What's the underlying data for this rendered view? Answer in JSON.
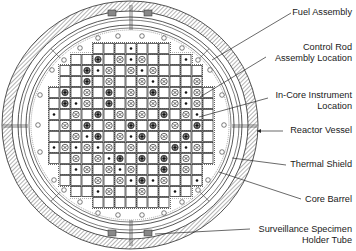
{
  "diagram": {
    "labels": [
      {
        "id": "fuel-assembly",
        "lines": [
          "Fuel Assembly"
        ],
        "x": 352,
        "y": 7,
        "target": [
          212,
          60
        ],
        "anchor": [
          291,
          13
        ]
      },
      {
        "id": "control-rod",
        "lines": [
          "Control Rod",
          "Assembly Location"
        ],
        "x": 352,
        "y": 42,
        "target": [
          200,
          97
        ],
        "anchor": [
          266,
          57
        ]
      },
      {
        "id": "in-core-instrument",
        "lines": [
          "In-Core Instrument",
          "Location"
        ],
        "x": 352,
        "y": 90,
        "target": [
          199,
          117
        ],
        "anchor": [
          268,
          98
        ]
      },
      {
        "id": "reactor-vessel",
        "lines": [
          "Reactor Vessel"
        ],
        "x": 352,
        "y": 125,
        "target": [
          257,
          131
        ],
        "anchor": [
          283,
          131
        ]
      },
      {
        "id": "thermal-shield",
        "lines": [
          "Thermal Shield"
        ],
        "x": 352,
        "y": 159,
        "target": [
          232,
          158
        ],
        "anchor": [
          286,
          165
        ]
      },
      {
        "id": "core-barrel",
        "lines": [
          "Core Barrel"
        ],
        "x": 352,
        "y": 194,
        "target": [
          219,
          172
        ],
        "anchor": [
          301,
          199
        ]
      },
      {
        "id": "surveillance-specimen",
        "lines": [
          "Surveillance Specimen",
          "Holder Tube"
        ],
        "x": 352,
        "y": 224,
        "target": [
          155,
          234
        ],
        "anchor": [
          250,
          229
        ]
      }
    ],
    "core": {
      "row_lengths": [
        7,
        11,
        13,
        13,
        15,
        15,
        15,
        15,
        15,
        15,
        15,
        13,
        13,
        11,
        7
      ],
      "legend": {
        "d": "in-core-instrument",
        "x": "control-rod",
        "b": "control-rod-bank",
        "": "fuel-assembly"
      },
      "rows": [
        [
          "",
          "",
          "",
          "d",
          "",
          "",
          ""
        ],
        [
          "",
          "",
          "b",
          "",
          "x",
          "d",
          "x",
          "",
          "",
          "",
          "d"
        ],
        [
          "",
          "",
          "b",
          "d",
          "x",
          "",
          "x",
          "d",
          "x",
          "",
          "",
          "",
          ""
        ],
        [
          "",
          "",
          "b",
          "",
          "x",
          "",
          "",
          "x",
          "d",
          "x",
          "",
          "",
          "x"
        ],
        [
          "",
          "b",
          "",
          "x",
          "",
          "b",
          "",
          "x",
          "",
          "b",
          "",
          "x",
          "d",
          "x",
          ""
        ],
        [
          "",
          "b",
          "d",
          "x",
          "",
          "b",
          "",
          "x",
          "",
          "x",
          "",
          "x",
          "d",
          "x",
          ""
        ],
        [
          "d",
          "",
          "x",
          "",
          "b",
          "",
          "x",
          "",
          "x",
          "",
          "b",
          "",
          "x",
          "d",
          ""
        ],
        [
          "",
          "x",
          "",
          "b",
          "",
          "x",
          "",
          "b",
          "",
          "b",
          "",
          "x",
          "",
          "b",
          ""
        ],
        [
          "",
          "",
          "x",
          "d",
          "b",
          "",
          "x",
          "d",
          "b",
          "",
          "x",
          "",
          "b",
          "",
          ""
        ],
        [
          "d",
          "x",
          "d",
          "x",
          "d",
          "x",
          "",
          "x",
          "",
          "x",
          "",
          "b",
          "d",
          "x",
          ""
        ],
        [
          "",
          "",
          "x",
          "",
          "x",
          "d",
          "b",
          "",
          "b",
          "",
          "b",
          "",
          "x",
          "",
          ""
        ],
        [
          "",
          "d",
          "x",
          "",
          "x",
          "d",
          "x",
          "",
          "",
          "b",
          "",
          "x",
          ""
        ],
        [
          "",
          "",
          "",
          "x",
          "",
          "x",
          "d",
          "b",
          "d",
          "x",
          "",
          "",
          "d"
        ],
        [
          "",
          "",
          "d",
          "x",
          "",
          "",
          "x",
          "",
          "",
          "d",
          ""
        ],
        [
          "",
          "",
          "",
          "",
          "",
          "",
          ""
        ]
      ]
    },
    "colors": {
      "ink": "#2a2a2a",
      "hatch": "#555555",
      "background": "#ffffff"
    }
  }
}
